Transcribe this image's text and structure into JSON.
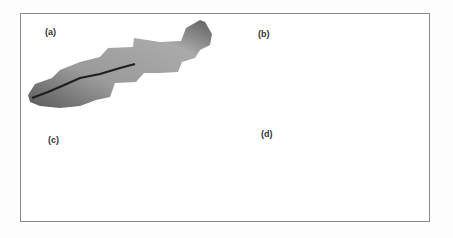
{
  "figure": {
    "panels": [
      {
        "id": "a",
        "label": "(a)",
        "description": "Watershed elevation map (grayscale shaded)"
      },
      {
        "id": "b",
        "label": "(b)",
        "description": "Gridded mesh / DEM grid over watershed"
      },
      {
        "id": "c",
        "label": "(c)",
        "description": "Watershed with stream network over elevation"
      },
      {
        "id": "d",
        "label": "(d)",
        "description": "Watershed subdivided into sub-basins"
      }
    ]
  },
  "colors": {
    "frame": "#8a8a8a",
    "dark": "#3a3a3a",
    "mid": "#8c8c8c",
    "light": "#bdbdbd",
    "channel": "#1e1e1e"
  }
}
